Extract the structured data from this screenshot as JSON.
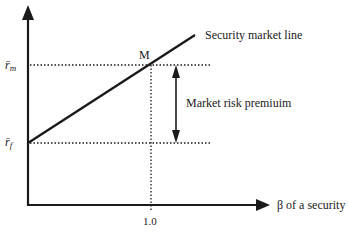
{
  "title": "Security market line",
  "labels": {
    "y_market_return": "r̄",
    "y_market_sub": "m",
    "y_riskfree_return": "r̄",
    "y_riskfree_sub": "f",
    "point_m": "M",
    "sml": "Security market line",
    "premium": "Market risk premiuim",
    "x_axis": "β of a security",
    "x_tick": "1.0"
  },
  "colors": {
    "ink": "#1a1a1a",
    "background": "#ffffff"
  }
}
